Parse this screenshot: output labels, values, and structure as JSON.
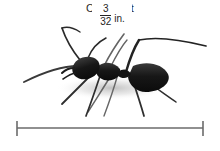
{
  "figure": {
    "title": "Crazy ant",
    "subject_icon": "ant-icon",
    "background_color": "#ffffff",
    "ink_color": "#1a1a1a"
  },
  "scale_bar": {
    "numerator": "3",
    "denominator": "32",
    "unit": "in.",
    "left_tick_icon": "tick-mark-icon",
    "right_tick_icon": "tick-mark-icon",
    "line_color": "#6b6b6b"
  }
}
